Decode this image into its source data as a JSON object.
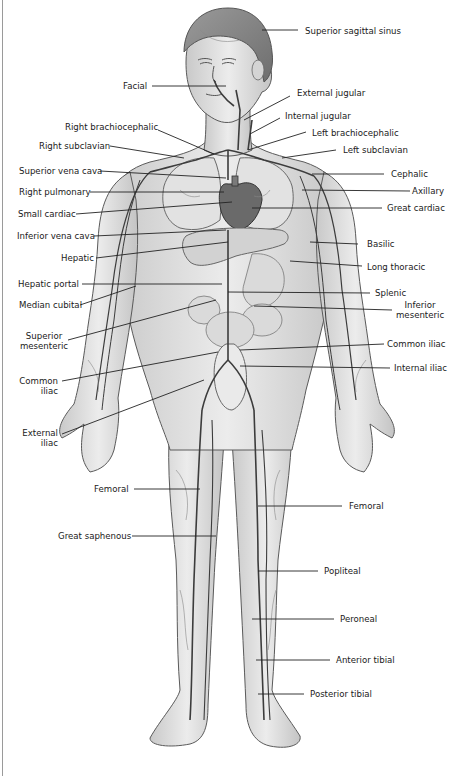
{
  "figure": {
    "colors": {
      "skin": "#e6e6e6",
      "skin_shade": "#bdbdbd",
      "outline": "#5a5a5a",
      "vein": "#3c3c3c",
      "label": "#1a1a1a",
      "leader": "#222222",
      "background": "#ffffff"
    }
  },
  "labels": {
    "superior_sagittal_sinus": "Superior sagittal sinus",
    "facial": "Facial",
    "external_jugular": "External jugular",
    "internal_jugular": "Internal jugular",
    "right_brachiocephalic": "Right brachiocephalic",
    "left_brachiocephalic": "Left brachiocephalic",
    "right_subclavian": "Right subclavian",
    "left_subclavian": "Left subclavian",
    "superior_vena_cava": "Superior vena cava",
    "cephalic": "Cephalic",
    "right_pulmonary": "Right pulmonary",
    "axillary": "Axillary",
    "small_cardiac": "Small cardiac",
    "great_cardiac": "Great cardiac",
    "inferior_vena_cava": "Inferior vena cava",
    "basilic": "Basilic",
    "hepatic": "Hepatic",
    "long_thoracic": "Long thoracic",
    "hepatic_portal": "Hepatic portal",
    "splenic": "Splenic",
    "median_cubital": "Median cubital",
    "inferior_mesenteric_1": "Inferior",
    "inferior_mesenteric_2": "mesenteric",
    "superior_mesenteric_1": "Superior",
    "superior_mesenteric_2": "mesenteric",
    "common_iliac_right": "Common iliac",
    "internal_iliac": "Internal iliac",
    "common_iliac_left_1": "Common",
    "common_iliac_left_2": "iliac",
    "external_iliac_1": "External",
    "external_iliac_2": "iliac",
    "femoral_left": "Femoral",
    "femoral_right": "Femoral",
    "great_saphenous": "Great saphenous",
    "popliteal": "Popliteal",
    "peroneal": "Peroneal",
    "anterior_tibial": "Anterior tibial",
    "posterior_tibial": "Posterior tibial"
  }
}
